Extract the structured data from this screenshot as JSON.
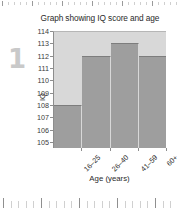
{
  "question": {
    "number": "1"
  },
  "chart_data": {
    "type": "bar",
    "title": "Graph showing IQ score and age",
    "xlabel": "Age (years)",
    "ylabel": "IQ",
    "categories": [
      "16–25",
      "26–40",
      "41–59",
      "60+"
    ],
    "values": [
      108,
      112,
      113,
      112
    ],
    "ylim": [
      104.5,
      114
    ],
    "yticks": [
      114,
      113,
      112,
      111,
      110,
      109,
      108,
      107,
      106,
      105
    ],
    "grid": false,
    "legend": "none",
    "colors": {
      "bar_fill": "#9e9e9e",
      "plot_background": "#d8d8d8",
      "axis": "#8d8d8d",
      "text": "#2b2b2b",
      "question_number": "#c9c9c9"
    }
  },
  "rulers": {
    "top_label": "page-ruler-top",
    "bottom_label": "page-ruler-bottom"
  }
}
